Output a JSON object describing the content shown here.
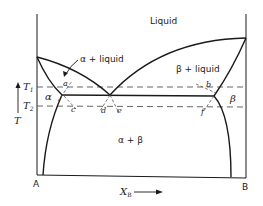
{
  "diagram": {
    "type": "binary eutectic phase diagram",
    "regions": {
      "liquid": "Liquid",
      "alpha_liquid": "α + liquid",
      "beta_liquid": "β + liquid",
      "alpha": "α",
      "beta": "β",
      "alpha_beta": "α + β"
    },
    "axes": {
      "y_label": "T",
      "x_label": "X",
      "x_label_sub": "B",
      "left_end": "A",
      "right_end": "B",
      "arrow": "→",
      "up_arrow": "↑"
    },
    "temperatures": {
      "t1": "T",
      "t1_sub": "1",
      "t2": "T",
      "t2_sub": "2"
    },
    "points": {
      "a": "a",
      "b": "b",
      "c": "c",
      "d": "d",
      "e": "e",
      "f": "f"
    },
    "colors": {
      "line": "#1a1a1a",
      "dashed": "#555555",
      "background": "#ffffff"
    }
  }
}
